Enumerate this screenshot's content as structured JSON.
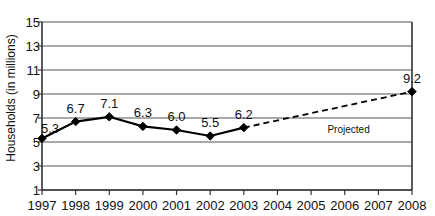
{
  "chart_data": {
    "type": "line",
    "title": "",
    "xlabel": "",
    "ylabel": "Households (in millions)",
    "x": [
      1997,
      1998,
      1999,
      2000,
      2001,
      2002,
      2003,
      2004,
      2005,
      2006,
      2007,
      2008
    ],
    "xticklabels": [
      "1997",
      "1998",
      "1999",
      "2000",
      "2001",
      "2002",
      "2003",
      "2004",
      "2005",
      "2006",
      "2007",
      "2008"
    ],
    "yticklabels": [
      "1",
      "3",
      "5",
      "7",
      "9",
      "11",
      "13",
      "15"
    ],
    "ytickvalues": [
      1,
      3,
      5,
      7,
      9,
      11,
      13,
      15
    ],
    "ylim": [
      1,
      15
    ],
    "xlim": [
      1997,
      2008
    ],
    "grid": "horizontal",
    "legend": "none",
    "series": [
      {
        "name": "Actual",
        "style": "solid",
        "marker": "diamond",
        "x": [
          1997,
          1998,
          1999,
          2000,
          2001,
          2002,
          2003
        ],
        "values": [
          5.3,
          6.7,
          7.1,
          6.3,
          6.0,
          5.5,
          6.2
        ],
        "point_labels": [
          "5.3",
          "6.7",
          "7.1",
          "6.3",
          "6.0",
          "5.5",
          "6.2"
        ]
      },
      {
        "name": "Projected",
        "style": "dashed",
        "marker": "diamond",
        "x": [
          2003,
          2008
        ],
        "values": [
          6.2,
          9.2
        ],
        "point_labels": [
          "",
          "9.2"
        ]
      }
    ],
    "annotations": [
      {
        "text": "Projected",
        "x": 2006.2,
        "y": 6.0
      }
    ],
    "colors": {
      "line": "#000000",
      "marker": "#000000",
      "grid": "#555555",
      "axis": "#333333",
      "text": "#111111",
      "background": "#ffffff"
    }
  }
}
